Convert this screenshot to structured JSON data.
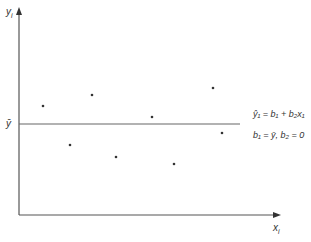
{
  "diagram": {
    "y_axis_label": "y",
    "y_axis_subscript": "i",
    "x_axis_label": "x",
    "x_axis_subscript": "i",
    "mean_label": "ȳ",
    "equation_1": "ŷ₁ = b₁ + b₂x₁",
    "equation_2": "b₁ = ȳ, b₂ = 0",
    "colors": {
      "axis": "#555555",
      "line": "#666666",
      "point": "#333333"
    }
  },
  "chart_data": {
    "type": "scatter",
    "title": "",
    "xlabel": "x_i",
    "ylabel": "y_i",
    "points_px": [
      {
        "x": 43,
        "y": 106
      },
      {
        "x": 92,
        "y": 95
      },
      {
        "x": 70,
        "y": 145
      },
      {
        "x": 116,
        "y": 157
      },
      {
        "x": 152,
        "y": 117
      },
      {
        "x": 213,
        "y": 88
      },
      {
        "x": 174,
        "y": 164
      },
      {
        "x": 222,
        "y": 133
      }
    ],
    "fitted_line": {
      "type": "horizontal",
      "label": "ŷ1 = b1 + b2x1",
      "note": "b1 = ȳ, b2 = 0",
      "y_px": 124
    },
    "grid": false,
    "legend": "none"
  }
}
